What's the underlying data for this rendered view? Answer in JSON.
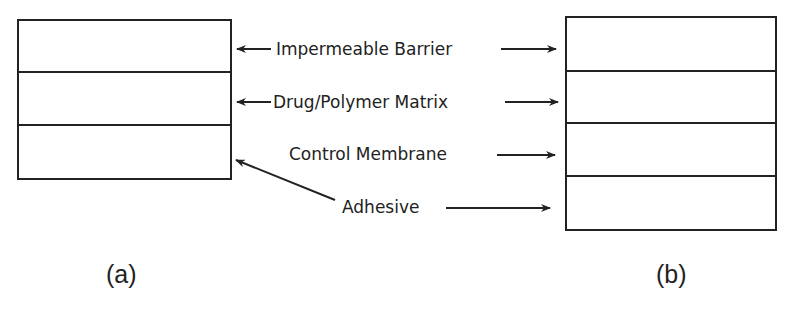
{
  "figure": {
    "panels": [
      {
        "caption": "(a)",
        "layers": 3
      },
      {
        "caption": "(b)",
        "layers": 4
      }
    ],
    "labels": [
      {
        "text": "Impermeable Barrier"
      },
      {
        "text": "Drug/Polymer Matrix"
      },
      {
        "text": "Control Membrane"
      },
      {
        "text": "Adhesive"
      }
    ],
    "colors": {
      "ink": "#222222",
      "background": "#ffffff"
    }
  }
}
